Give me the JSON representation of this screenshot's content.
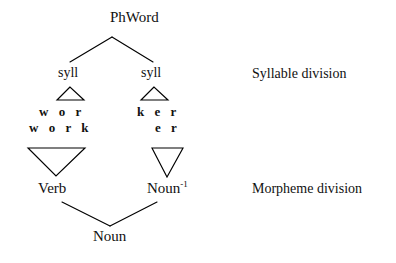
{
  "diagram": {
    "line_color": "#000000",
    "background_color": "#ffffff",
    "nodes": {
      "root": "PhWord",
      "syllable_left": "syll",
      "syllable_right": "syll",
      "syllable_melody_left": "w o r",
      "syllable_melody_right": "k e r",
      "morpheme_melody_left": "w o r k",
      "morpheme_melody_right": "e r",
      "morpheme_left": "Verb",
      "morpheme_right_base": "Noun",
      "morpheme_right_superscript": "-1",
      "bottom": "Noun"
    },
    "annotations": [
      {
        "id": "syllable-division",
        "label": "Syllable division"
      },
      {
        "id": "morpheme-division",
        "label": "Morpheme division"
      }
    ]
  }
}
